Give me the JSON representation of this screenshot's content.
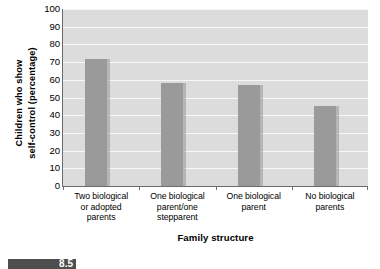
{
  "chart_data": {
    "type": "bar",
    "title": "",
    "xlabel": "Family structure",
    "ylabel": "Children who show self-control (percentage)",
    "ylabel_line1": "Children who show",
    "ylabel_line2": "self-control (percentage)",
    "categories": [
      "Two biological or adopted parents",
      "One biological parent/one stepparent",
      "One biological parent",
      "No biological parents"
    ],
    "category_lines": [
      [
        "Two biological",
        "or adopted",
        "parents"
      ],
      [
        "One biological",
        "parent/one",
        "stepparent"
      ],
      [
        "One biological",
        "parent"
      ],
      [
        "No biological",
        "parents"
      ]
    ],
    "values": [
      72,
      58,
      57,
      45
    ],
    "ylim": [
      0,
      100
    ],
    "ytick_values": [
      0,
      10,
      20,
      30,
      40,
      50,
      60,
      70,
      80,
      90,
      100
    ],
    "ytick_labels": [
      "0",
      "10",
      "20",
      "30",
      "40",
      "50",
      "60",
      "70",
      "80",
      "90",
      "100"
    ],
    "grid": true,
    "grid_orientation": "horizontal",
    "legend": false,
    "colors": {
      "bar": "#9a9a9a",
      "plot_background": "#dcdcdc",
      "gridline": "#f7f7f7",
      "axis": "#6b6b6b",
      "text": "#000000"
    }
  },
  "bottom_banner": {
    "text": "8.5",
    "background": "#4e4e4e"
  }
}
